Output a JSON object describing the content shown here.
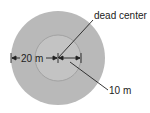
{
  "diagram": {
    "type": "concentric-circles",
    "labels": {
      "center": "dead center",
      "outer_radius": "20 m",
      "inner_radius": "10 m"
    },
    "colors": {
      "outer_fill": "#b9b9b9",
      "inner_fill": "#c3c3c3",
      "inner_stroke": "#9a9a9a",
      "line": "#222222",
      "background": "#ffffff"
    }
  }
}
